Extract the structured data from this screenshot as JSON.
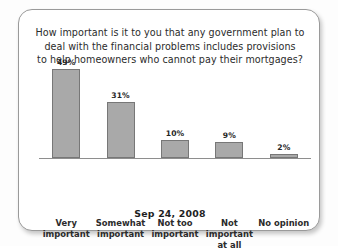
{
  "card": {
    "title_lines": [
      "How important is it to you that any government plan to",
      "deal with the financial problems includes provisions",
      "to help homeowners who cannot pay their mortgages?"
    ],
    "caption": "Sep 24, 2008"
  },
  "colors": {
    "bar_fill": "#a9a9a9",
    "bar_border": "#777777",
    "axis": "#8e8e8e",
    "text": "#2b2b2b",
    "card_border": "#9a9a9a",
    "card_background": "#ffffff"
  },
  "chart_data": {
    "type": "bar",
    "title": "How important is it to you that any government plan to deal with the financial problems includes provisions to help homeowners who cannot pay their mortgages?",
    "subtitle": "Sep 24, 2008",
    "xlabel": "",
    "ylabel": "",
    "ylim": [
      0,
      55
    ],
    "grid": false,
    "legend": "none",
    "categories": [
      "Very important",
      "Somewhat important",
      "Not too important",
      "Not important at all",
      "No opinion"
    ],
    "category_lines": [
      [
        "Very",
        "important"
      ],
      [
        "Somewhat",
        "important"
      ],
      [
        "Not too",
        "important"
      ],
      [
        "Not",
        "important",
        "at all"
      ],
      [
        "No opinion"
      ]
    ],
    "values": [
      49,
      31,
      10,
      9,
      2
    ],
    "value_labels": [
      "49%",
      "31%",
      "10%",
      "9%",
      "2%"
    ]
  }
}
